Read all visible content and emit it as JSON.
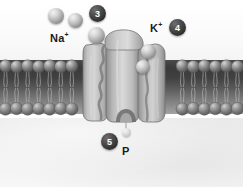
{
  "figure": {
    "compartments": {
      "extracellular_label": "extracellular-space",
      "cytoplasm_label": "cytoplasm"
    },
    "membrane": {
      "type": "phospholipid-bilayer",
      "outer_heads": 22,
      "inner_heads": 22
    },
    "protein": {
      "name": "sodium-potassium-pump",
      "color": "#b9b9b9"
    }
  },
  "labels": {
    "sodium": "Na",
    "sodium_charge": "+",
    "potassium": "K",
    "potassium_charge": "+",
    "phosphate": "P"
  },
  "badges": [
    {
      "id": "step-3",
      "number": "3"
    },
    {
      "id": "step-4",
      "number": "4"
    },
    {
      "id": "step-5",
      "number": "5"
    }
  ],
  "ions": {
    "sodium_count": 3,
    "potassium_count": 2,
    "phosphate_count": 1
  },
  "colors": {
    "badge_fill": "#2d2d2d",
    "badge_text": "#ffffff",
    "label_text": "#1b1b1b",
    "membrane_tails": "#3a3a3a",
    "lipid_head": "#8f8f8f",
    "protein_fill": "#b9b9b9",
    "ion_fill": "#bdbdbd",
    "cytoplasm_bg": "#efefef",
    "extracellular_bg": "#fbfbfb"
  }
}
